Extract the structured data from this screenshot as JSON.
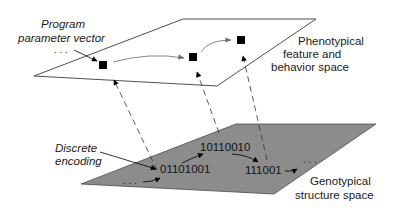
{
  "diagram": {
    "type": "two-level genotype-phenotype mapping",
    "phenotype_plane": {
      "label_lines": [
        "Phenotypical",
        "feature and",
        "behavior space"
      ],
      "fill": "#ffffff",
      "nodes": [
        "point-1",
        "point-2",
        "point-3"
      ],
      "pointer_label_lines": [
        "Program",
        "parameter vector"
      ],
      "ellipsis": ". . ."
    },
    "genotype_plane": {
      "label_lines": [
        "Genotypical",
        "structure space"
      ],
      "fill": "#8c8c8c",
      "encodings": [
        "01101001",
        "10110010",
        "111001"
      ],
      "pointer_label_lines": [
        "Discrete",
        "encoding"
      ],
      "ellipsis_start": ". . .",
      "ellipsis_end": ". . ."
    },
    "mappings": [
      {
        "from": "01101001",
        "to": "point-1"
      },
      {
        "from": "10110010",
        "to": "point-2"
      },
      {
        "from": "111001",
        "to": "point-3"
      }
    ],
    "colors": {
      "line": "#3a3a3a",
      "phenotype_arrow": "#777777",
      "square": "#000000"
    }
  }
}
